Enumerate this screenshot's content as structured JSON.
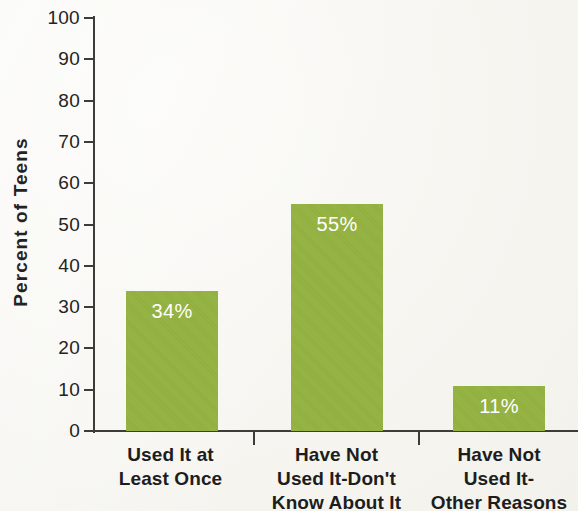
{
  "chart_data": {
    "type": "bar",
    "title": "",
    "xlabel": "",
    "ylabel": "Percent of Teens",
    "ylim": [
      0,
      100
    ],
    "yticks": [
      0,
      10,
      20,
      30,
      40,
      50,
      60,
      70,
      80,
      90,
      100
    ],
    "ytick_labels": [
      "0",
      "10",
      "20",
      "30",
      "40",
      "50",
      "60",
      "70",
      "80",
      "90",
      "100"
    ],
    "grid": false,
    "legend": null,
    "bar_color": "#93b23f",
    "value_label_color": "#ffffff",
    "background_color": "#f7f6f1",
    "axis_color": "#3c3c38",
    "categories": [
      "Used It at Least Once",
      "Have Not Used It-Don't Know About It",
      "Have Not Used It-Other Reasons"
    ],
    "category_lines": [
      [
        "Used It at",
        "Least Once"
      ],
      [
        "Have Not",
        "Used It-Don't",
        "Know About It"
      ],
      [
        "Have Not",
        "Used It-",
        "Other Reasons"
      ]
    ],
    "values": [
      34,
      55,
      11
    ],
    "value_labels": [
      "34%",
      "55%",
      "11%"
    ]
  }
}
